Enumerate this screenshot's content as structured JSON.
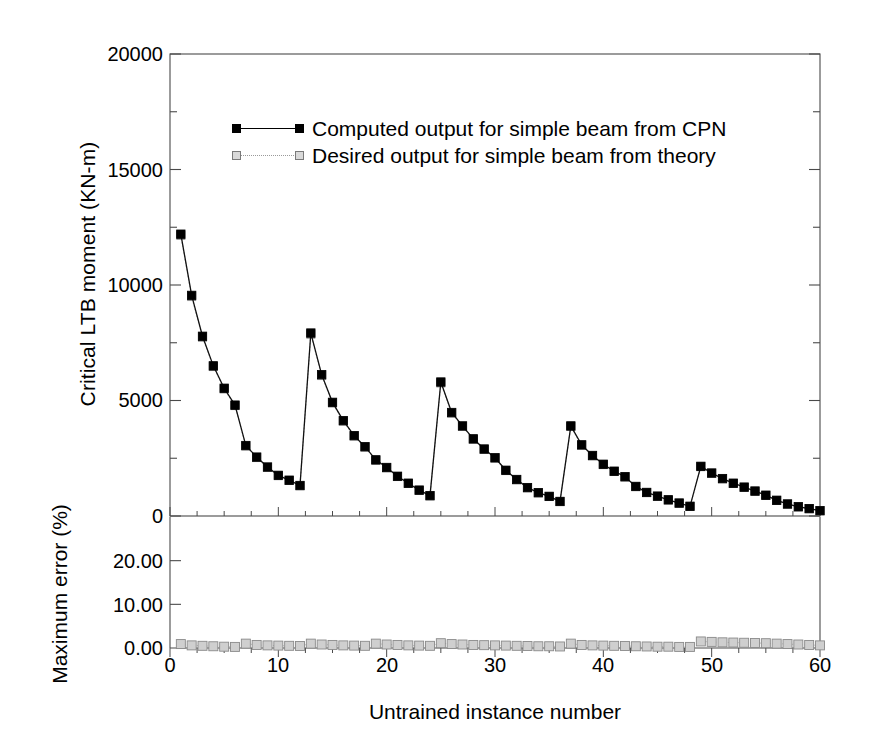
{
  "chart_data": {
    "type": "line",
    "title": "",
    "xlabel": "Untrained instance number",
    "ylabel_upper": "Critical LTB moment (KN-m)",
    "ylabel_lower": "Maximum error (%)",
    "xlim": [
      0,
      60
    ],
    "xticks": [
      "0",
      "10",
      "20",
      "30",
      "40",
      "50",
      "60"
    ],
    "xtick_values": [
      0,
      10,
      20,
      30,
      40,
      50,
      60
    ],
    "xminor_step": 2.5,
    "grid": false,
    "legend_position": "upper-center",
    "panels": [
      {
        "name": "upper-panel",
        "ylim": [
          0,
          20000
        ],
        "yticks": [
          "0",
          "5000",
          "10000",
          "15000",
          "20000"
        ],
        "ytick_values": [
          0,
          5000,
          10000,
          15000,
          20000
        ],
        "yminor_step": 2500,
        "series": [
          {
            "name": "Computed output for simple beam from CPN",
            "marker": "filled-square",
            "line": "solid",
            "color": "#000000",
            "x": [
              1,
              2,
              3,
              4,
              5,
              6,
              7,
              8,
              9,
              10,
              11,
              12,
              13,
              14,
              15,
              16,
              17,
              18,
              19,
              20,
              21,
              22,
              23,
              24,
              25,
              26,
              27,
              28,
              29,
              30,
              31,
              32,
              33,
              34,
              35,
              36,
              37,
              38,
              39,
              40,
              41,
              42,
              43,
              44,
              45,
              46,
              47,
              48,
              49,
              50,
              51,
              52,
              53,
              54,
              55,
              56,
              57,
              58,
              59,
              60
            ],
            "y": [
              12200,
              9550,
              7780,
              6500,
              5530,
              4800,
              3050,
              2550,
              2120,
              1760,
              1550,
              1320,
              7920,
              6120,
              4920,
              4130,
              3480,
              3000,
              2430,
              2100,
              1720,
              1420,
              1120,
              880,
              5800,
              4480,
              3900,
              3340,
              2900,
              2520,
              1980,
              1580,
              1230,
              1010,
              850,
              630,
              3900,
              3080,
              2620,
              2240,
              1940,
              1700,
              1280,
              1020,
              860,
              700,
              560,
              420,
              2150,
              1860,
              1620,
              1420,
              1250,
              1080,
              900,
              680,
              520,
              400,
              320,
              230
            ]
          },
          {
            "name": "Desired output for simple beam from theory",
            "marker": "open-square",
            "line": "dotted",
            "color": "#b0b0b0",
            "x": [
              1,
              2,
              3,
              4,
              5,
              6,
              7,
              8,
              9,
              10,
              11,
              12,
              13,
              14,
              15,
              16,
              17,
              18,
              19,
              20,
              21,
              22,
              23,
              24,
              25,
              26,
              27,
              28,
              29,
              30,
              31,
              32,
              33,
              34,
              35,
              36,
              37,
              38,
              39,
              40,
              41,
              42,
              43,
              44,
              45,
              46,
              47,
              48,
              49,
              50,
              51,
              52,
              53,
              54,
              55,
              56,
              57,
              58,
              59,
              60
            ],
            "y": [
              12150,
              9500,
              7740,
              6470,
              5500,
              4780,
              3030,
              2530,
              2105,
              1745,
              1538,
              1308,
              7870,
              6080,
              4890,
              4105,
              3460,
              2980,
              2415,
              2085,
              1708,
              1410,
              1112,
              873,
              5760,
              4450,
              3875,
              3318,
              2880,
              2504,
              1966,
              1569,
              1221,
              1002,
              843,
              624,
              3875,
              3058,
              2602,
              2224,
              1926,
              1688,
              1270,
              1012,
              853,
              694,
              555,
              416,
              2135,
              1846,
              1608,
              1409,
              1240,
              1071,
              892,
              674,
              515,
              396,
              317,
              228
            ]
          }
        ]
      },
      {
        "name": "lower-panel",
        "ylim": [
          0,
          30
        ],
        "yticks": [
          "0.00",
          "10.00",
          "20.00"
        ],
        "ytick_values": [
          0,
          10,
          20
        ],
        "series": [
          {
            "name": "Maximum error (%)",
            "marker": "open-square",
            "line": "dotted",
            "color": "#c8c8c8",
            "x": [
              1,
              2,
              3,
              4,
              5,
              6,
              7,
              8,
              9,
              10,
              11,
              12,
              13,
              14,
              15,
              16,
              17,
              18,
              19,
              20,
              21,
              22,
              23,
              24,
              25,
              26,
              27,
              28,
              29,
              30,
              31,
              32,
              33,
              34,
              35,
              36,
              37,
              38,
              39,
              40,
              41,
              42,
              43,
              44,
              45,
              46,
              47,
              48,
              49,
              50,
              51,
              52,
              53,
              54,
              55,
              56,
              57,
              58,
              59,
              60
            ],
            "y": [
              0.9,
              0.6,
              0.5,
              0.4,
              0.3,
              0.25,
              1.0,
              0.7,
              0.6,
              0.55,
              0.5,
              0.45,
              1.0,
              0.8,
              0.7,
              0.6,
              0.55,
              0.5,
              1.0,
              0.8,
              0.7,
              0.6,
              0.55,
              0.5,
              1.1,
              0.9,
              0.8,
              0.7,
              0.65,
              0.6,
              0.55,
              0.5,
              0.45,
              0.4,
              0.4,
              0.35,
              1.0,
              0.7,
              0.6,
              0.55,
              0.5,
              0.45,
              0.4,
              0.35,
              0.3,
              0.3,
              0.25,
              0.25,
              1.5,
              1.4,
              1.3,
              1.25,
              1.2,
              1.15,
              1.1,
              1.0,
              0.9,
              0.8,
              0.7,
              0.6
            ]
          }
        ]
      }
    ],
    "legend_entries": [
      "Computed output for simple beam from CPN",
      "Desired output for simple beam from theory"
    ]
  },
  "colors": {
    "axis": "#4a4a4a",
    "computed_marker": "#000000",
    "desired_marker": "#d9d9d9",
    "error_bar_fill": "#cfcfcf",
    "error_bar_edge": "#8a8a8a"
  }
}
